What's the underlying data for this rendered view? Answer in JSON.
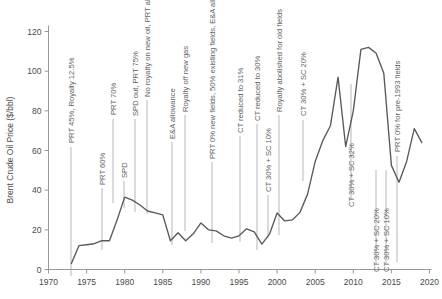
{
  "chart_data": {
    "type": "line",
    "title": "",
    "subtitle": "",
    "xlabel": "",
    "ylabel": "Brent Crude Oil Price ($/bbl)",
    "xlim": [
      1970,
      2020
    ],
    "ylim": [
      0,
      120
    ],
    "grid": false,
    "legend": "none",
    "xticks": [
      1970,
      1975,
      1980,
      1985,
      1990,
      1995,
      2000,
      2005,
      2010,
      2015,
      2020
    ],
    "yticks": [
      0,
      20,
      40,
      60,
      80,
      100,
      120
    ],
    "series": [
      {
        "name": "Brent Crude Oil Price",
        "x": [
          1973,
          1974,
          1975,
          1976,
          1977,
          1978,
          1979,
          1980,
          1981,
          1982,
          1983,
          1984,
          1985,
          1986,
          1987,
          1988,
          1989,
          1990,
          1991,
          1992,
          1993,
          1994,
          1995,
          1996,
          1997,
          1998,
          1999,
          2000,
          2001,
          2002,
          2003,
          2004,
          2005,
          2006,
          2007,
          2008,
          2009,
          2010,
          2011,
          2012,
          2013,
          2014,
          2015,
          2016,
          2017,
          2018,
          2019
        ],
        "values": [
          3,
          12,
          12.5,
          13,
          14.5,
          14.5,
          25,
          36.5,
          35,
          32.5,
          29.5,
          28.5,
          27.5,
          14.5,
          18.5,
          14.5,
          18,
          23.5,
          20,
          19.5,
          17,
          15.8,
          17,
          20.5,
          19,
          12.8,
          17.8,
          28.5,
          24.5,
          25,
          28.8,
          38,
          54.5,
          65,
          72.5,
          97,
          62,
          80,
          111,
          112,
          109,
          99,
          52.5,
          44,
          54.5,
          71,
          64
        ]
      }
    ],
    "annotations": [
      {
        "label": "PRT 45%, Royalty 12.5%",
        "year": 1975,
        "label_x": 71,
        "label_y_bottom": 143,
        "leader_top": 147,
        "leader_bottom": 276
      },
      {
        "label": "PRT 60%",
        "year": 1979,
        "label_x": 102,
        "label_y_bottom": 185,
        "leader_top": 188,
        "leader_bottom": 250
      },
      {
        "label": "PRT 70%",
        "year": 1980,
        "label_x": 113,
        "label_y_bottom": 115,
        "leader_top": 119,
        "leader_bottom": 203
      },
      {
        "label": "SPD",
        "year": 1981,
        "label_x": 124,
        "label_y_bottom": 178,
        "leader_top": 181,
        "leader_bottom": 208
      },
      {
        "label": "SPD out, PRT 75%",
        "year": 1983,
        "label_x": 135,
        "label_y_bottom": 116,
        "leader_top": 119,
        "leader_bottom": 212
      },
      {
        "label": "No royalty on new oil, PRT allowance doubled",
        "year": 1983,
        "label_x": 147,
        "label_y_bottom": 97,
        "leader_top": 100,
        "leader_bottom": 214
      },
      {
        "label": "E&A allowance",
        "year": 1987,
        "label_x": 172,
        "label_y_bottom": 139,
        "leader_top": 142,
        "leader_bottom": 245
      },
      {
        "label": "Royalty off new gas",
        "year": 1989,
        "label_x": 185,
        "label_y_bottom": 112,
        "leader_top": 115,
        "leader_bottom": 231
      },
      {
        "label": "PRT 0% new fields, 50% existing fields, E&A allowance out",
        "year": 1993,
        "label_x": 212,
        "label_y_bottom": 159,
        "leader_top": 162,
        "leader_bottom": 243
      },
      {
        "label": "CT reduced to 31%",
        "year": 1997,
        "label_x": 240,
        "label_y_bottom": 133,
        "leader_top": 136,
        "leader_bottom": 242
      },
      {
        "label": "CT reduced to 30%",
        "year": 1999,
        "label_x": 257,
        "label_y_bottom": 121,
        "leader_top": 124,
        "leader_bottom": 250
      },
      {
        "label": "CT 30% + SC 10%",
        "year": 2002,
        "label_x": 268,
        "label_y_bottom": 192,
        "leader_top": 195,
        "leader_bottom": 238
      },
      {
        "label": "Royalty abolished for old fields",
        "year": 2003,
        "label_x": 279,
        "label_y_bottom": 112,
        "leader_top": 115,
        "leader_bottom": 235
      },
      {
        "label": "CT 30% + SC 20%",
        "year": 2006,
        "label_x": 303,
        "label_y_bottom": 116,
        "leader_top": 120,
        "leader_bottom": 181
      },
      {
        "label": "CT 30% + SC 32%",
        "year": 2011,
        "label_x": 351,
        "label_y_bottom": 207,
        "leader_top": 84,
        "leader_bottom": 200
      },
      {
        "label": "CT 30% + SC 20%",
        "year": 2015,
        "label_x": 376,
        "label_y_bottom": 272,
        "leader_top": 170,
        "leader_bottom": 264
      },
      {
        "label": "CT 30% + SC 10%",
        "year": 2016,
        "label_x": 386,
        "label_y_bottom": 272,
        "leader_top": 170,
        "leader_bottom": 264
      },
      {
        "label": "PRT 0% for pre-1993 fields",
        "year": 2016,
        "label_x": 397,
        "label_y_bottom": 152,
        "leader_top": 156,
        "leader_bottom": 262
      }
    ]
  }
}
